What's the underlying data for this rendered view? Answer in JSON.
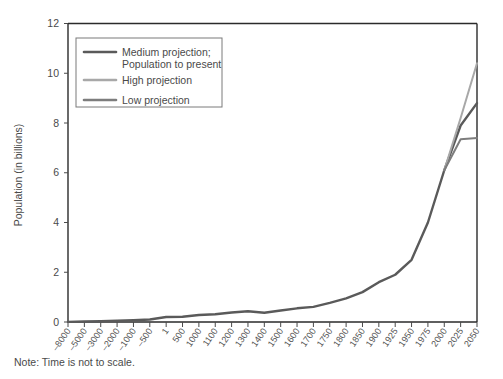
{
  "figure": {
    "note": "Note: Time is not to scale."
  },
  "legend": {
    "position": "upper-left-inside",
    "entries": [
      {
        "label_line1": "Medium projection;",
        "label_line2": "Population to present",
        "color": "#5a5a5a"
      },
      {
        "label_line1": "High projection",
        "label_line2": "",
        "color": "#a8a8a8"
      },
      {
        "label_line1": "Low projection",
        "label_line2": "",
        "color": "#7d7d7d"
      }
    ]
  },
  "chart_data": {
    "type": "line",
    "title": "",
    "subtitle": "",
    "xlabel": "",
    "ylabel": "Population (in billions)",
    "ylim": [
      0,
      12
    ],
    "yticks": [
      0,
      2,
      4,
      6,
      8,
      10,
      12
    ],
    "ytick_labels": [
      "0",
      "2",
      "4",
      "6",
      "8",
      "10",
      "12"
    ],
    "grid": false,
    "legend_position": "upper left",
    "x_axis_note": "Time is not to scale.",
    "categories": [
      "–8000",
      "–5000",
      "–3000",
      "–2000",
      "–1000",
      "–500",
      "1",
      "500",
      "1000",
      "1100",
      "1200",
      "1300",
      "1400",
      "1500",
      "1600",
      "1700",
      "1750",
      "1800",
      "1850",
      "1900",
      "1925",
      "1950",
      "1975",
      "2000",
      "2025",
      "2050"
    ],
    "series": [
      {
        "name": "Medium projection; Population to present",
        "color": "#5a5a5a",
        "values": [
          0.005,
          0.02,
          0.03,
          0.05,
          0.07,
          0.1,
          0.2,
          0.21,
          0.28,
          0.31,
          0.38,
          0.43,
          0.37,
          0.46,
          0.55,
          0.61,
          0.77,
          0.95,
          1.2,
          1.6,
          1.9,
          2.5,
          4.0,
          6.1,
          7.9,
          8.8
        ]
      },
      {
        "name": "High projection",
        "color": "#a8a8a8",
        "values": [
          null,
          null,
          null,
          null,
          null,
          null,
          null,
          null,
          null,
          null,
          null,
          null,
          null,
          null,
          null,
          null,
          null,
          null,
          null,
          null,
          null,
          null,
          null,
          6.1,
          8.2,
          10.4
        ]
      },
      {
        "name": "Low projection",
        "color": "#7d7d7d",
        "values": [
          null,
          null,
          null,
          null,
          null,
          null,
          null,
          null,
          null,
          null,
          null,
          null,
          null,
          null,
          null,
          null,
          null,
          null,
          null,
          null,
          null,
          null,
          null,
          6.1,
          7.35,
          7.4
        ]
      }
    ]
  }
}
